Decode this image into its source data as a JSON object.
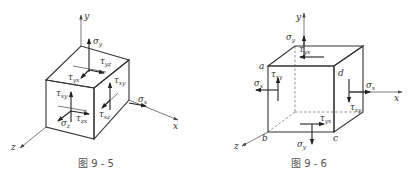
{
  "figures": [
    {
      "caption": "图 9 - 5",
      "axes": {
        "x": "x",
        "y": "y",
        "z": "z"
      },
      "labels": {
        "sigma_y": {
          "main": "σ",
          "sub": "y"
        },
        "tau_yz": {
          "main": "τ",
          "sub": "yz"
        },
        "tau_yx": {
          "main": "τ",
          "sub": "yx"
        },
        "tau_zy": {
          "main": "τ",
          "sub": "zy"
        },
        "tau_xy": {
          "main": "τ",
          "sub": "xy"
        },
        "tau_xz": {
          "main": "τ",
          "sub": "xz"
        },
        "tau_zx": {
          "main": "τ",
          "sub": "zx"
        },
        "sigma_x": {
          "main": "σ",
          "sub": "x"
        },
        "sigma_z": {
          "main": "σ",
          "sub": "z"
        }
      }
    },
    {
      "caption": "图 9 - 6",
      "axes": {
        "x": "x",
        "y": "y",
        "z": "z"
      },
      "corners": {
        "a": "a",
        "b": "b",
        "c": "c",
        "d": "d"
      },
      "labels": {
        "sigma_y_top": {
          "main": "σ",
          "sub": "y"
        },
        "tau_yx_top": {
          "main": "τ",
          "sub": "yx"
        },
        "tau_xy_left": {
          "main": "τ",
          "sub": "xy"
        },
        "sigma_x_left": {
          "main": "σ",
          "sub": "x"
        },
        "sigma_x_right": {
          "main": "σ",
          "sub": "x"
        },
        "tau_xy_right": {
          "main": "τ",
          "sub": "xy"
        },
        "tau_yx_bottom": {
          "main": "τ",
          "sub": "yx"
        },
        "sigma_y_bottom": {
          "main": "σ",
          "sub": "y"
        }
      }
    }
  ]
}
